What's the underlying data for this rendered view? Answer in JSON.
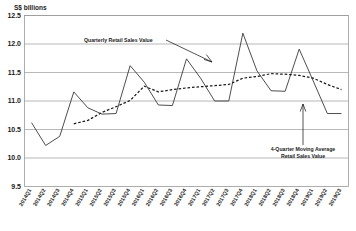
{
  "chart_data": {
    "type": "line",
    "title": "",
    "ylabel": "S$ billions",
    "xlabel": "",
    "ylim": [
      9.5,
      12.5
    ],
    "yticks": [
      "9.5",
      "10.0",
      "10.5",
      "11.0",
      "11.5",
      "12.0",
      "12.5"
    ],
    "grid": true,
    "legend": "annotations",
    "categories": [
      "2014Q1",
      "2014Q2",
      "2014Q3",
      "2014Q4",
      "2015Q1",
      "2015Q2",
      "2015Q3",
      "2015Q4",
      "2016Q1",
      "2016Q2",
      "2016Q3",
      "2016Q4",
      "2017Q1",
      "2017Q2",
      "2017Q3",
      "2017Q4",
      "2018Q1",
      "2018Q2",
      "2018Q3",
      "2018Q4",
      "2019Q1",
      "2019Q2",
      "2019Q3"
    ],
    "series": [
      {
        "name": "Quarterly Retail Sales Value",
        "style": "solid",
        "values": [
          10.62,
          10.22,
          10.38,
          11.16,
          10.88,
          10.77,
          10.78,
          11.62,
          11.33,
          10.93,
          10.92,
          11.74,
          11.4,
          11.0,
          11.0,
          12.19,
          11.53,
          11.18,
          11.17,
          11.91,
          11.35,
          10.78,
          10.78
        ]
      },
      {
        "name": "4-Quarter Moving Average Retail Sales Value",
        "style": "dashed",
        "values": [
          null,
          null,
          null,
          10.6,
          10.66,
          10.8,
          10.9,
          11.01,
          11.26,
          11.16,
          11.2,
          11.23,
          11.25,
          11.27,
          11.29,
          11.4,
          11.43,
          11.48,
          11.47,
          11.45,
          11.4,
          11.29,
          11.2
        ]
      }
    ],
    "annotations": [
      {
        "id": "quarterly",
        "text": "Quarterly Retail Sales Value"
      },
      {
        "id": "moving-average-line1",
        "text": "4-Quarter Moving Average"
      },
      {
        "id": "moving-average-line2",
        "text": "Retail Sales Value"
      }
    ],
    "colors": {
      "series": "#3a3a3a",
      "moving_average": "#1a1a1a",
      "grid": "#9a9a9a"
    }
  }
}
